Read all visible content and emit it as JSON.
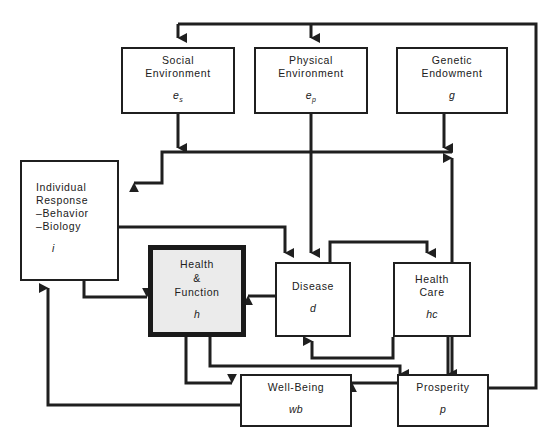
{
  "diagram": {
    "background_color": "#ffffff",
    "line_color": "#1f1f1f",
    "highlight_fill": "#ebebeb",
    "nodes": [
      {
        "id": "social_environment",
        "label": "Social\nEnvironment",
        "symbol": "e",
        "subscript": "s",
        "highlighted": false
      },
      {
        "id": "physical_environment",
        "label": "Physical\nEnvironment",
        "symbol": "e",
        "subscript": "p",
        "highlighted": false
      },
      {
        "id": "genetic_endowment",
        "label": "Genetic\nEndowment",
        "symbol": "g",
        "subscript": "",
        "highlighted": false
      },
      {
        "id": "individual_response",
        "label": "Individual\nResponse\n–Behavior\n–Biology",
        "symbol": "i",
        "subscript": "",
        "highlighted": false
      },
      {
        "id": "health_function",
        "label": "Health\n&\nFunction",
        "symbol": "h",
        "subscript": "",
        "highlighted": true
      },
      {
        "id": "disease",
        "label": "Disease",
        "symbol": "d",
        "subscript": "",
        "highlighted": false
      },
      {
        "id": "health_care",
        "label": "Health\nCare",
        "symbol": "hc",
        "subscript": "",
        "highlighted": false
      },
      {
        "id": "well_being",
        "label": "Well-Being",
        "symbol": "wb",
        "subscript": "",
        "highlighted": false
      },
      {
        "id": "prosperity",
        "label": "Prosperity",
        "symbol": "p",
        "subscript": "",
        "highlighted": false
      }
    ],
    "edges": [
      {
        "from": "prosperity",
        "to": "social_environment"
      },
      {
        "from": "prosperity",
        "to": "physical_environment"
      },
      {
        "from": "social_environment",
        "to": "individual_response"
      },
      {
        "from": "physical_environment",
        "to": "individual_response"
      },
      {
        "from": "genetic_endowment",
        "to": "individual_response"
      },
      {
        "from": "physical_environment",
        "to": "disease"
      },
      {
        "from": "individual_response",
        "to": "disease"
      },
      {
        "from": "individual_response",
        "to": "health_function"
      },
      {
        "from": "disease",
        "to": "health_function"
      },
      {
        "from": "disease",
        "to": "health_care"
      },
      {
        "from": "health_care",
        "to": "disease"
      },
      {
        "from": "prosperity",
        "to": "health_care"
      },
      {
        "from": "health_care",
        "to": "prosperity"
      },
      {
        "from": "health_function",
        "to": "well_being"
      },
      {
        "from": "health_function",
        "to": "prosperity"
      },
      {
        "from": "prosperity",
        "to": "well_being"
      },
      {
        "from": "well_being",
        "to": "individual_response"
      }
    ]
  }
}
